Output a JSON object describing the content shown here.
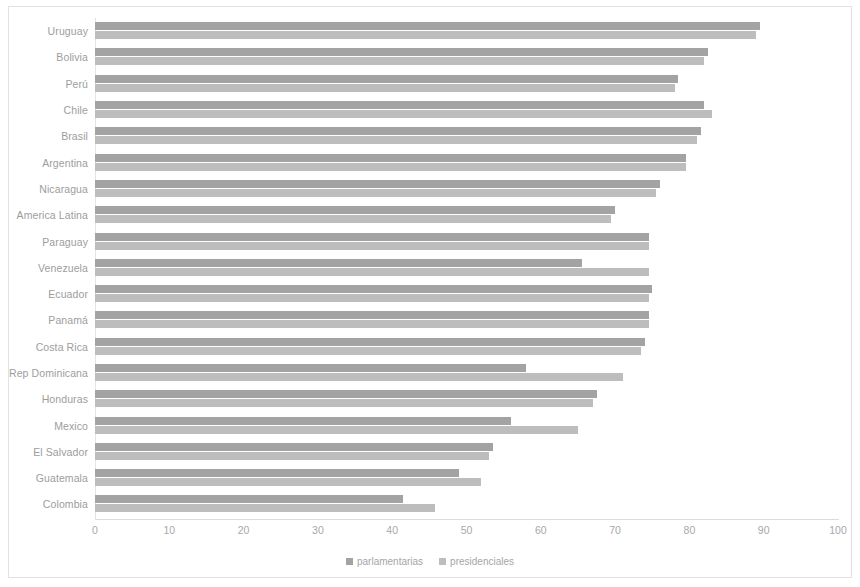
{
  "chart_data": {
    "type": "bar",
    "orientation": "horizontal",
    "title": "",
    "subtitle": "",
    "xlabel": "",
    "ylabel": "",
    "xlim": [
      0,
      100
    ],
    "xticks": [
      "0",
      "10",
      "20",
      "30",
      "40",
      "50",
      "60",
      "70",
      "80",
      "90",
      "100"
    ],
    "grid": false,
    "legend_position": "bottom",
    "categories": [
      "Uruguay",
      "Bolivia",
      "Perú",
      "Chile",
      "Brasil",
      "Argentina",
      "Nicaragua",
      "America Latina",
      "Paraguay",
      "Venezuela",
      "Ecuador",
      "Panamá",
      "Costa Rica",
      "Rep Dominicana",
      "Honduras",
      "Mexico",
      "El Salvador",
      "Guatemala",
      "Colombia"
    ],
    "series": [
      {
        "name": "parlamentarias",
        "color": "#a3a3a3",
        "values": [
          89.5,
          82.5,
          78.5,
          82.0,
          81.5,
          79.5,
          76.0,
          70.0,
          74.5,
          65.5,
          75.0,
          74.5,
          74.0,
          58.0,
          67.5,
          56.0,
          53.5,
          49.0,
          41.5
        ]
      },
      {
        "name": "presidenciales",
        "color": "#bdbdbd",
        "values": [
          89.0,
          82.0,
          78.0,
          83.0,
          81.0,
          79.5,
          75.5,
          69.5,
          74.5,
          74.5,
          74.5,
          74.5,
          73.5,
          71.0,
          67.0,
          65.0,
          53.0,
          52.0,
          45.7
        ]
      }
    ]
  },
  "legend": {
    "items": [
      {
        "label": "parlamentarias",
        "color": "#a3a3a3"
      },
      {
        "label": "presidenciales",
        "color": "#bdbdbd"
      }
    ]
  }
}
